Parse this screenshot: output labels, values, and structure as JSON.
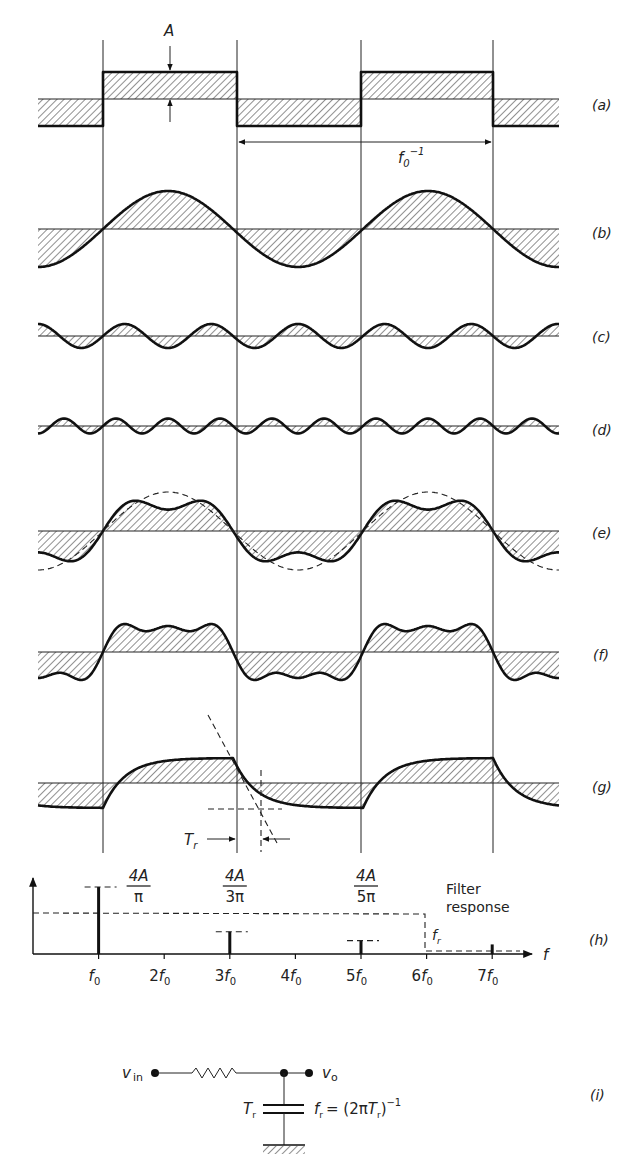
{
  "figure": {
    "period_label": "f0^-1",
    "amplitude_label": "A"
  },
  "panels": [
    {
      "id": "a",
      "label": "(a)",
      "name": "Square wave of amplitude A",
      "baseline": 99,
      "type": "square",
      "amp": 27
    },
    {
      "id": "b",
      "label": "(b)",
      "name": "Fundamental (1st harmonic)",
      "baseline": 229,
      "type": "harmonic",
      "n": 1,
      "amp": 38
    },
    {
      "id": "c",
      "label": "(c)",
      "name": "3rd harmonic",
      "baseline": 336,
      "type": "harmonic",
      "n": 3,
      "amp": 12
    },
    {
      "id": "d",
      "label": "(d)",
      "name": "5th harmonic",
      "baseline": 426,
      "type": "harmonic",
      "n": 5,
      "amp": 7.5
    },
    {
      "id": "e",
      "label": "(e)",
      "name": "Sum of 1st + 3rd harmonics (dashed: fundamental)",
      "baseline": 531,
      "type": "sum",
      "harmonics": [
        1,
        3
      ],
      "amp": 36
    },
    {
      "id": "f",
      "label": "(f)",
      "name": "Sum of 1st + 3rd + 5th harmonics",
      "baseline": 652,
      "type": "sum",
      "harmonics": [
        1,
        3,
        5
      ],
      "amp": 33
    },
    {
      "id": "g",
      "label": "(g)",
      "name": "Filtered square wave showing rise time",
      "baseline": 783,
      "type": "rc",
      "amp": 25
    },
    {
      "id": "h",
      "label": "(h)",
      "name": "Amplitude spectrum and filter response"
    },
    {
      "id": "i",
      "label": "(i)",
      "name": "RC low-pass filter"
    }
  ],
  "rise_time": {
    "label": "T",
    "sub": "r"
  },
  "spectrum": {
    "axis_label": "f",
    "ticks": [
      "f0",
      "2f0",
      "3f0",
      "4f0",
      "5f0",
      "6f0",
      "7f0"
    ],
    "lines": [
      {
        "harmonic": "f0",
        "num": "4A",
        "den": "π",
        "relative_height": 1.0
      },
      {
        "harmonic": "3f0",
        "num": "4A",
        "den": "3π",
        "relative_height": 0.333
      },
      {
        "harmonic": "5f0",
        "num": "4A",
        "den": "5π",
        "relative_height": 0.2
      },
      {
        "harmonic": "7f0",
        "num": "",
        "den": "",
        "relative_height": 0.143
      }
    ],
    "filter_label_line1": "Filter",
    "filter_label_line2": "response",
    "cutoff_label": "f",
    "cutoff_sub": "r",
    "cutoff_at": "6f0"
  },
  "circuit": {
    "input_label": "v",
    "input_sub": "in",
    "output_label": "v",
    "output_sub": "o",
    "cap_label": "T",
    "cap_sub": "r",
    "formula_lhs": "f",
    "formula_lhs_sub": "r",
    "formula_rhs": "= (2π",
    "formula_T": "T",
    "formula_T_sub": "r",
    "formula_close": ")",
    "formula_exp": "−1"
  },
  "colors": {
    "ink": "#111111",
    "background": "#ffffff",
    "hatch": "#333333"
  }
}
